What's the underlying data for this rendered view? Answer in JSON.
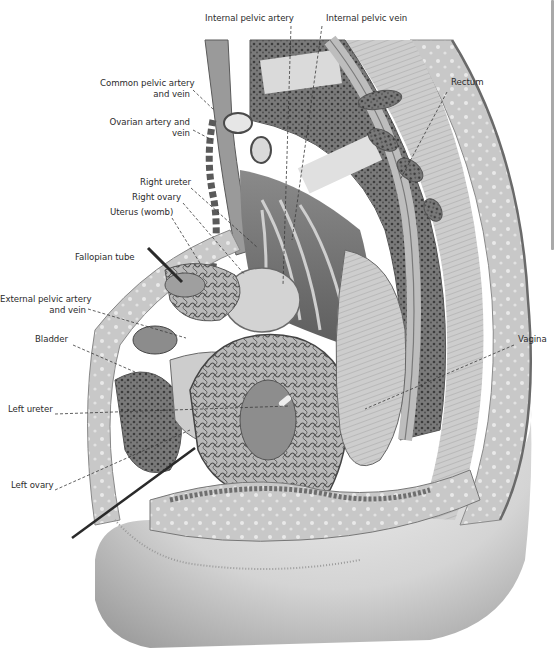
{
  "diagram": {
    "style": "grayscale engraving",
    "labels": [
      {
        "id": "internal-pelvic-artery",
        "text": "Internal pelvic artery",
        "x": 205,
        "y": 18,
        "align": "left",
        "target": [
          283,
          285
        ]
      },
      {
        "id": "internal-pelvic-vein",
        "text": "Internal pelvic vein",
        "x": 326,
        "y": 18,
        "align": "left",
        "target": [
          292,
          240
        ]
      },
      {
        "id": "common-pelvic-artery-and-vein",
        "text": "Common pelvic artery\nand vein",
        "x": 98,
        "y": 83,
        "align": "right",
        "target": [
          214,
          110
        ]
      },
      {
        "id": "ovarian-artery-and-vein",
        "text": "Ovarian artery and\nvein",
        "x": 112,
        "y": 122,
        "align": "right",
        "target": [
          212,
          140
        ]
      },
      {
        "id": "rectum",
        "text": "Rectum",
        "x": 451,
        "y": 82,
        "align": "left",
        "target": [
          400,
          180
        ]
      },
      {
        "id": "right-ureter",
        "text": "Right ureter",
        "x": 140,
        "y": 182,
        "align": "left",
        "target": [
          258,
          248
        ]
      },
      {
        "id": "right-ovary",
        "text": "Right ovary",
        "x": 132,
        "y": 197,
        "align": "left",
        "target": [
          245,
          275
        ]
      },
      {
        "id": "uterus-womb",
        "text": "Uterus (womb)",
        "x": 110,
        "y": 212,
        "align": "left",
        "target": [
          203,
          268
        ]
      },
      {
        "id": "fallopian-tube",
        "text": "Fallopian tube",
        "x": 75,
        "y": 257,
        "align": "left",
        "target": [
          175,
          276
        ]
      },
      {
        "id": "external-pelvic-artery-and-vein",
        "text": "External pelvic artery\nand vein",
        "x": 10,
        "y": 299,
        "align": "right",
        "target": [
          186,
          338
        ]
      },
      {
        "id": "bladder",
        "text": "Bladder",
        "x": 35,
        "y": 339,
        "align": "left",
        "target": [
          135,
          372
        ]
      },
      {
        "id": "vagina",
        "text": "Vagina",
        "x": 518,
        "y": 339,
        "align": "left",
        "target": [
          365,
          409
        ]
      },
      {
        "id": "left-ureter",
        "text": "Left ureter",
        "x": 8,
        "y": 409,
        "align": "left",
        "target": [
          290,
          406
        ]
      },
      {
        "id": "left-ovary",
        "text": "Left ovary",
        "x": 11,
        "y": 485,
        "align": "left",
        "target": [
          190,
          430
        ]
      }
    ],
    "colors": {
      "label_text": "#2b2b2b",
      "leader_line": "#3a3a3a",
      "tissue_light": "#d9d9d9",
      "tissue_mid": "#a8a8a8",
      "tissue_dark": "#5a5a5a",
      "background": "#ffffff"
    }
  },
  "viewer": {
    "scrollbar": {
      "thumb_top": 0,
      "thumb_height": 250,
      "track_height": 652
    }
  }
}
